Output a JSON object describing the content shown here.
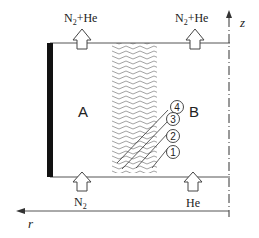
{
  "diagram": {
    "top_outlet_left": {
      "main": "N",
      "sub": "2",
      "rest": "+He"
    },
    "top_outlet_right": {
      "main": "N",
      "sub": "2",
      "rest": "+He"
    },
    "bottom_inlet_left": {
      "main": "N",
      "sub": "2"
    },
    "bottom_inlet_right": {
      "main": "He"
    },
    "chamber_a_label": "A",
    "chamber_b_label": "B",
    "axis_z_label": "z",
    "axis_r_label": "r",
    "membrane_labels": [
      "④",
      "③",
      "②",
      "①"
    ]
  }
}
